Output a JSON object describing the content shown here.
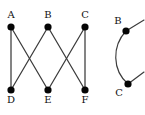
{
  "figure": {
    "background_color": "#ffffff",
    "edge_color": "#3b3b3b",
    "vertex_color": "#050505",
    "label_color": "#111111",
    "panels": [
      {
        "name": "bipartite-graph",
        "vertices": [
          {
            "id": "A",
            "label": "A",
            "x": 11,
            "y": 27,
            "label_x": 11,
            "label_y": 18
          },
          {
            "id": "B",
            "label": "B",
            "x": 48,
            "y": 27,
            "label_x": 48,
            "label_y": 18
          },
          {
            "id": "C",
            "label": "C",
            "x": 85,
            "y": 27,
            "label_x": 85,
            "label_y": 18
          },
          {
            "id": "D",
            "label": "D",
            "x": 11,
            "y": 90,
            "label_x": 11,
            "label_y": 103
          },
          {
            "id": "E",
            "label": "E",
            "x": 48,
            "y": 90,
            "label_x": 48,
            "label_y": 103
          },
          {
            "id": "F",
            "label": "F",
            "x": 85,
            "y": 90,
            "label_x": 85,
            "label_y": 103
          }
        ],
        "edges": [
          {
            "from": "A",
            "to": "D"
          },
          {
            "from": "A",
            "to": "E"
          },
          {
            "from": "B",
            "to": "D"
          },
          {
            "from": "B",
            "to": "F"
          },
          {
            "from": "C",
            "to": "E"
          },
          {
            "from": "C",
            "to": "F"
          }
        ]
      },
      {
        "name": "arc-graph",
        "vertices": [
          {
            "id": "B2",
            "label": "B",
            "x": 126,
            "y": 31,
            "label_x": 118,
            "label_y": 24
          },
          {
            "id": "C2",
            "label": "C",
            "x": 128,
            "y": 84,
            "label_x": 119,
            "label_y": 96
          }
        ],
        "arc": {
          "from": "B2",
          "to": "C2",
          "bow": "left"
        },
        "stubs": [
          {
            "from": "B2",
            "dx": 18,
            "dy": -11
          },
          {
            "from": "C2",
            "dx": 16,
            "dy": -12
          }
        ]
      }
    ]
  }
}
